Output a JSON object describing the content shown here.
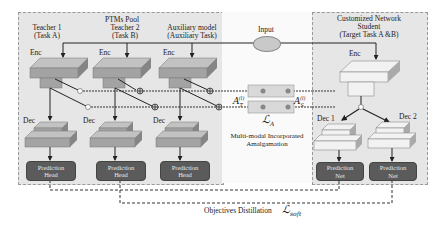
{
  "pool": {
    "title": "PTMs Pool",
    "teachers": [
      {
        "name": "Teacher 1",
        "task": "(Task A)",
        "enc": "Enc",
        "dec": "Dec",
        "head": [
          "Prediction",
          "Head"
        ]
      },
      {
        "name": "Teacher 2",
        "task": "(Task B)",
        "enc": "Enc",
        "dec": "Dec",
        "head": [
          "Prediction",
          "Head"
        ]
      },
      {
        "name": "Auxiliary model",
        "task": "(Auxiliary Task)",
        "enc": "Enc",
        "dec": "Dec",
        "head": [
          "Prediction",
          "Head"
        ]
      }
    ]
  },
  "input": {
    "label": "Input"
  },
  "student": {
    "title": "Customized Network",
    "subtitle": "Student",
    "task": "(Target Task A &B)",
    "enc": "Enc",
    "dec1": "Dec 1",
    "dec2": "Dec 2",
    "net1": [
      "Prediction",
      "Net"
    ],
    "net2": [
      "Prediction",
      "Net"
    ]
  },
  "amalgamation": {
    "a_t": "A",
    "a_t_sub": "T",
    "a_t_sup": "(l)",
    "a_s": "A",
    "a_s_sub": "S",
    "a_s_sup": "(l)",
    "loss": "ℒ",
    "loss_sub": "A",
    "caption1": "Multi-modal Incorporated",
    "caption2": "Amalgamation"
  },
  "distillation": {
    "label": "Objectives Distillation",
    "loss": "ℒ",
    "loss_sub": "soft"
  },
  "colors": {
    "panel": "#e6e6e6",
    "block_top": "#b8b8b8",
    "block_front": "#9a9a9a",
    "block_side": "#7d7d7d",
    "pill": "#5b5b5b",
    "line": "#222222"
  }
}
